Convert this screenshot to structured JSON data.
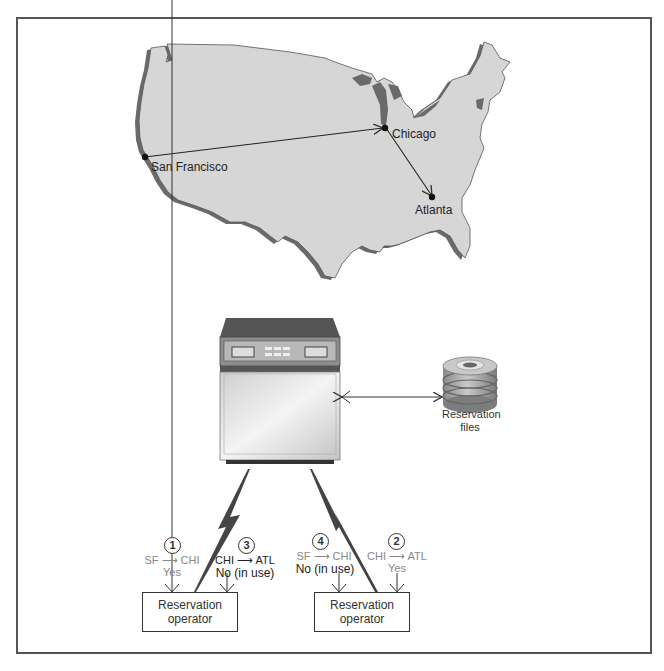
{
  "map": {
    "cities": [
      {
        "name": "San Francisco",
        "x": 145,
        "y": 157
      },
      {
        "name": "Chicago",
        "x": 385,
        "y": 128
      },
      {
        "name": "Atlanta",
        "x": 432,
        "y": 197
      }
    ],
    "routes": [
      {
        "from": "San Francisco",
        "to": "Chicago"
      },
      {
        "from": "Chicago",
        "to": "Atlanta"
      }
    ]
  },
  "system": {
    "mainframe_label": "",
    "storage_label_line1": "Reservation",
    "storage_label_line2": "files"
  },
  "operators": [
    {
      "label_line1": "Reservation",
      "label_line2": "operator",
      "requests": [
        {
          "step": "1",
          "route_from": "SF",
          "route_to": "CHI",
          "result": "Yes"
        },
        {
          "step": "3",
          "route_from": "CHI",
          "route_to": "ATL",
          "result": "No (in use)"
        }
      ]
    },
    {
      "label_line1": "Reservation",
      "label_line2": "operator",
      "requests": [
        {
          "step": "4",
          "route_from": "SF",
          "route_to": "CHI",
          "result": "No (in use)"
        },
        {
          "step": "2",
          "route_from": "CHI",
          "route_to": "ATL",
          "result": "Yes"
        }
      ]
    }
  ],
  "colors": {
    "land": "#d6d6d6",
    "coast_shadow": "#6a6a6a",
    "frame": "#555555",
    "line": "#333333"
  }
}
